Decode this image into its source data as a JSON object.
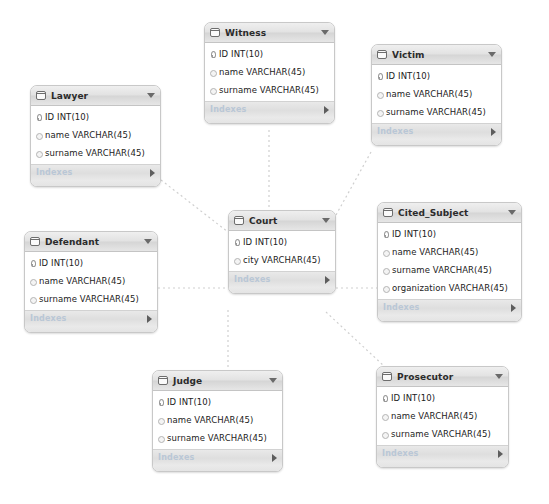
{
  "diagram": {
    "kind": "eer-diagram",
    "background_color": "#ffffff",
    "connector_color": "#cfcfcf",
    "connector_style": "dashed",
    "footer_label": "Indexes",
    "header_icon": "table-icon",
    "header_caret_icon": "chevron-down-icon",
    "footer_arrow_icon": "triangle-right-icon",
    "column_pk_icon": "key-icon",
    "column_plain_icon": "diamond-icon"
  },
  "tables": [
    {
      "id": "witness",
      "name": "Witness",
      "x": 204,
      "y": 22,
      "w": 131,
      "columns": [
        {
          "label": "ID INT(10)",
          "key": "pk"
        },
        {
          "label": "name VARCHAR(45)",
          "key": "nm"
        },
        {
          "label": "surname VARCHAR(45)",
          "key": "nm"
        }
      ]
    },
    {
      "id": "victim",
      "name": "Victim",
      "x": 371,
      "y": 44,
      "w": 131,
      "columns": [
        {
          "label": "ID INT(10)",
          "key": "pk"
        },
        {
          "label": "name VARCHAR(45)",
          "key": "nm"
        },
        {
          "label": "surname VARCHAR(45)",
          "key": "nm"
        }
      ]
    },
    {
      "id": "lawyer",
      "name": "Lawyer",
      "x": 30,
      "y": 85,
      "w": 131,
      "columns": [
        {
          "label": "ID INT(10)",
          "key": "pk"
        },
        {
          "label": "name VARCHAR(45)",
          "key": "nm"
        },
        {
          "label": "surname VARCHAR(45)",
          "key": "nm"
        }
      ]
    },
    {
      "id": "court",
      "name": "Court",
      "x": 228,
      "y": 210,
      "w": 108,
      "columns": [
        {
          "label": "ID INT(10)",
          "key": "pk"
        },
        {
          "label": "city VARCHAR(45)",
          "key": "nm"
        }
      ]
    },
    {
      "id": "cited_subject",
      "name": "Cited_Subject",
      "x": 377,
      "y": 202,
      "w": 145,
      "columns": [
        {
          "label": "ID INT(10)",
          "key": "pk"
        },
        {
          "label": "name VARCHAR(45)",
          "key": "nm"
        },
        {
          "label": "surname VARCHAR(45)",
          "key": "nm"
        },
        {
          "label": "organization VARCHAR(45)",
          "key": "nm"
        }
      ]
    },
    {
      "id": "defendant",
      "name": "Defendant",
      "x": 24,
      "y": 231,
      "w": 134,
      "columns": [
        {
          "label": "ID INT(10)",
          "key": "pk"
        },
        {
          "label": "name VARCHAR(45)",
          "key": "nm"
        },
        {
          "label": "surname VARCHAR(45)",
          "key": "nm"
        }
      ]
    },
    {
      "id": "judge",
      "name": "Judge",
      "x": 152,
      "y": 370,
      "w": 131,
      "columns": [
        {
          "label": "ID INT(10)",
          "key": "pk"
        },
        {
          "label": "name VARCHAR(45)",
          "key": "nm"
        },
        {
          "label": "surname VARCHAR(45)",
          "key": "nm"
        }
      ]
    },
    {
      "id": "prosecutor",
      "name": "Prosecutor",
      "x": 376,
      "y": 366,
      "w": 133,
      "columns": [
        {
          "label": "ID INT(10)",
          "key": "pk"
        },
        {
          "label": "name VARCHAR(45)",
          "key": "nm"
        },
        {
          "label": "surname VARCHAR(45)",
          "key": "nm"
        }
      ]
    }
  ],
  "relationships": [
    {
      "id": "witness-court",
      "from": "Witness",
      "to": "Court",
      "points": "269,130 269,210"
    },
    {
      "id": "victim-court",
      "from": "Victim",
      "to": "Court",
      "points": "371,152 336,215"
    },
    {
      "id": "lawyer-court",
      "from": "Lawyer",
      "to": "Court",
      "points": "161,180 228,232"
    },
    {
      "id": "defendant-court",
      "from": "Defendant",
      "to": "Court",
      "points": "158,288 228,288"
    },
    {
      "id": "court-cited_subject",
      "from": "Court",
      "to": "Cited_Subject",
      "points": "336,288 377,288"
    },
    {
      "id": "court-judge",
      "from": "Court",
      "to": "Judge",
      "points": "228,310 228,370"
    },
    {
      "id": "court-prosecutor",
      "from": "Court",
      "to": "Prosecutor",
      "points": "326,312 384,366"
    }
  ]
}
